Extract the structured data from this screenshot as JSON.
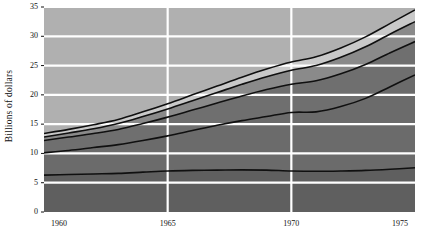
{
  "chart_data": {
    "type": "area",
    "title": "",
    "subtitle": "",
    "xlabel": "",
    "ylabel": "Billions of dollars",
    "x": [
      1960,
      1961,
      1962,
      1963,
      1964,
      1965,
      1966,
      1967,
      1968,
      1969,
      1970,
      1971,
      1972,
      1973,
      1974,
      1975
    ],
    "xlim": [
      1960,
      1975
    ],
    "ylim": [
      0,
      35
    ],
    "xticks": [
      1960,
      1965,
      1970,
      1975
    ],
    "xticklabels": [
      "1960",
      "1965",
      "1970",
      "1975"
    ],
    "yticks": [
      0,
      5,
      10,
      15,
      20,
      25,
      30,
      35
    ],
    "yticklabels": [
      "0",
      "5",
      "10",
      "15",
      "20",
      "25",
      "30",
      "35"
    ],
    "grid": true,
    "grid_color": "#ffffff",
    "legend": "none",
    "stacked": true,
    "series": [
      {
        "name": "band-1-bottom",
        "values": [
          6.3,
          6.4,
          6.5,
          6.6,
          6.8,
          7.0,
          7.1,
          7.15,
          7.2,
          7.15,
          7.0,
          6.95,
          7.0,
          7.1,
          7.3,
          7.55
        ]
      },
      {
        "name": "band-2",
        "values": [
          10.1,
          10.5,
          11.0,
          11.5,
          12.2,
          13.0,
          13.9,
          14.8,
          15.6,
          16.3,
          17.0,
          17.1,
          18.0,
          19.4,
          21.4,
          23.4
        ]
      },
      {
        "name": "band-3",
        "values": [
          12.2,
          12.8,
          13.4,
          14.1,
          15.1,
          16.2,
          17.4,
          18.6,
          19.8,
          20.9,
          21.8,
          22.4,
          23.6,
          25.2,
          27.2,
          29.1
        ]
      },
      {
        "name": "band-4",
        "values": [
          12.8,
          13.5,
          14.2,
          15.1,
          16.3,
          17.6,
          19.0,
          20.4,
          21.8,
          23.1,
          24.2,
          25.0,
          26.4,
          28.2,
          30.4,
          32.5
        ]
      },
      {
        "name": "band-5-top",
        "values": [
          13.4,
          14.1,
          14.9,
          15.8,
          17.1,
          18.5,
          20.0,
          21.5,
          23.0,
          24.4,
          25.6,
          26.5,
          28.0,
          29.9,
          32.2,
          34.5
        ]
      }
    ],
    "colors": {
      "background_upper": "#b0b0b0",
      "band_fill_dark": "#757575",
      "band_fill_mid": "#6f6f6f",
      "band_fill_light": "#c9c9c9",
      "line": "#101010",
      "grid": "#ffffff",
      "text": "#111111"
    }
  }
}
